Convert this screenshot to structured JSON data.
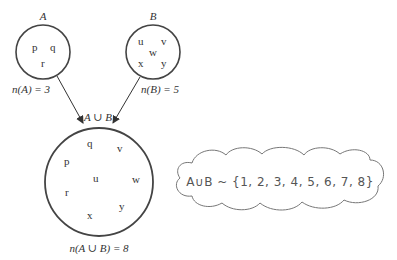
{
  "diagram": {
    "set_a": {
      "label": "A",
      "elements": [
        "p",
        "q",
        "r"
      ],
      "cardinality_label": "n(A) = 3"
    },
    "set_b": {
      "label": "B",
      "elements": [
        "u",
        "v",
        "w",
        "x",
        "y"
      ],
      "cardinality_label": "n(B) = 5"
    },
    "union": {
      "label": "A ∪ B",
      "elements": [
        "q",
        "v",
        "p",
        "u",
        "w",
        "r",
        "y",
        "x"
      ],
      "cardinality_label": "n(A ∪ B) = 8"
    },
    "cloud": {
      "text": "A∪B ~ {1, 2, 3, 4, 5, 6, 7, 8}"
    },
    "colors": {
      "stroke": "#444444",
      "text": "#333333",
      "cloud_stroke": "#777777"
    }
  }
}
